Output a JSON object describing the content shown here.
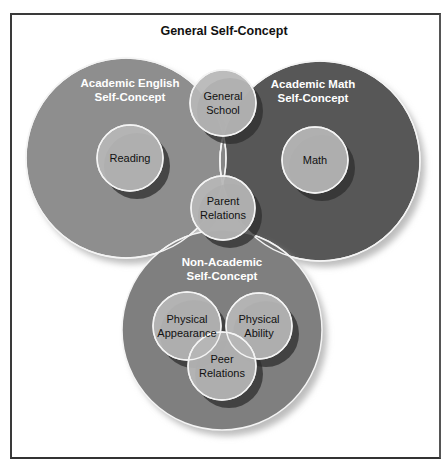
{
  "title": "General Self-Concept",
  "colors": {
    "english": "#8e8e8e",
    "math": "#575757",
    "lens": "#868686",
    "nonacademic": "#7f7f7f",
    "small": "#b7b7b7",
    "outline": "#f4f4f4",
    "shadow": "#2e2e2e"
  },
  "big_circles": [
    {
      "id": "english",
      "cx": 126,
      "cy": 158,
      "r": 100,
      "line1": "Academic English",
      "line2": "Self-Concept",
      "lx": 130,
      "ly1": 87,
      "ly2": 101
    },
    {
      "id": "math",
      "cx": 320,
      "cy": 161,
      "r": 100,
      "line1": "Academic Math",
      "line2": "Self-Concept",
      "lx": 313,
      "ly1": 88,
      "ly2": 102
    },
    {
      "id": "nonacademic",
      "cx": 222,
      "cy": 330,
      "r": 100,
      "line1": "Non-Academic",
      "line2": "Self-Concept",
      "lx": 222,
      "ly1": 266,
      "ly2": 280
    }
  ],
  "small_circles": [
    {
      "id": "general-school",
      "cx": 223,
      "cy": 103,
      "r": 33,
      "line1": "General",
      "line2": "School"
    },
    {
      "id": "reading",
      "cx": 130,
      "cy": 158,
      "r": 33,
      "line1": "Reading",
      "line2": ""
    },
    {
      "id": "math-sub",
      "cx": 315,
      "cy": 160,
      "r": 33,
      "line1": "Math",
      "line2": ""
    },
    {
      "id": "parent-relations",
      "cx": 223,
      "cy": 208,
      "r": 32,
      "line1": "Parent",
      "line2": "Relations"
    },
    {
      "id": "physical-appearance",
      "cx": 187,
      "cy": 326,
      "r": 34,
      "line1": "Physical",
      "line2": "Appearance"
    },
    {
      "id": "physical-ability",
      "cx": 259,
      "cy": 326,
      "r": 33,
      "line1": "Physical",
      "line2": "Ability"
    },
    {
      "id": "peer-relations",
      "cx": 222,
      "cy": 366,
      "r": 34,
      "line1": "Peer",
      "line2": "Relations"
    }
  ]
}
